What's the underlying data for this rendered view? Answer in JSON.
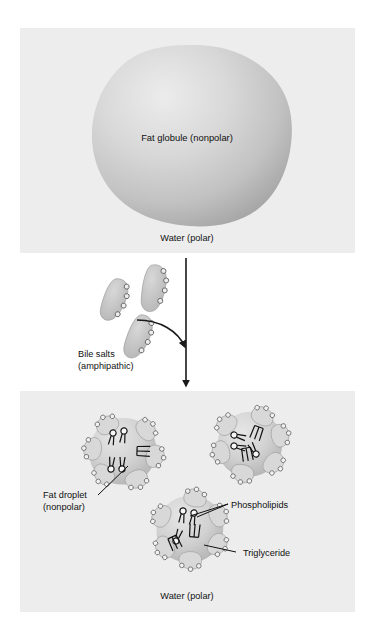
{
  "figure": {
    "background_color": "#ffffff",
    "panel_color": "#eeeeee"
  },
  "panels": [
    {
      "name": "top-panel",
      "caption": "Water (polar)",
      "objects": [
        {
          "name": "fat-globule",
          "label": "Fat globule (nonpolar)"
        }
      ]
    },
    {
      "name": "middle-panel",
      "objects": [
        {
          "name": "bile-salts",
          "label_line1": "Bile salts",
          "label_line2": "(amphipathic)"
        }
      ]
    },
    {
      "name": "bottom-panel",
      "caption": "Water (polar)",
      "objects": [
        {
          "name": "fat-droplet",
          "label_line1": "Fat droplet",
          "label_line2": "(nonpolar)"
        },
        {
          "name": "phospholipids",
          "label": "Phospholipids"
        },
        {
          "name": "triglyceride",
          "label": "Triglyceride"
        }
      ]
    }
  ],
  "labels": {
    "fat_globule": "Fat globule (nonpolar)",
    "water_top": "Water (polar)",
    "bile_salts_line1": "Bile salts",
    "bile_salts_line2": "(amphipathic)",
    "fat_droplet_line1": "Fat droplet",
    "fat_droplet_line2": "(nonpolar)",
    "phospholipids": "Phospholipids",
    "triglyceride": "Triglyceride",
    "water_bottom": "Water (polar)"
  },
  "colors": {
    "panel_bg": "#ededed",
    "globule_light": "#e3e3e3",
    "globule_mid": "#c9c9c9",
    "globule_dark": "#a8a8a8",
    "bile_salt_fill": "#c6c6c6",
    "droplet_fill": "#d4d4d4",
    "line": "#1a1a1a",
    "text": "#111111"
  }
}
